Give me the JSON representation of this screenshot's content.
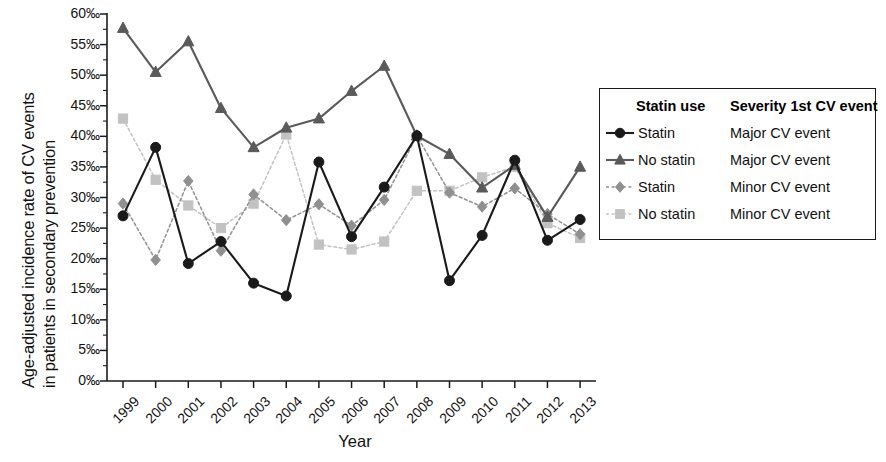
{
  "chart_data": {
    "type": "line",
    "title": "",
    "xlabel": "Year",
    "ylabel_line1": "Age-adjusted incidence rate of CV events",
    "ylabel_line2": "in patients in secondary prevention",
    "categories": [
      "1999",
      "2000",
      "2001",
      "2002",
      "2003",
      "2004",
      "2005",
      "2006",
      "2007",
      "2008",
      "2009",
      "2010",
      "2011",
      "2012",
      "2013"
    ],
    "ytick_labels": [
      "60‰",
      "55‰",
      "50‰",
      "45‰",
      "40‰",
      "35‰",
      "30‰",
      "25‰",
      "20‰",
      "15‰",
      "10‰",
      "5‰",
      "0‰"
    ],
    "ytick_values": [
      60,
      55,
      50,
      45,
      40,
      35,
      30,
      25,
      20,
      15,
      10,
      5,
      0
    ],
    "ylim": [
      0,
      60
    ],
    "grid": false,
    "legend_position": "right",
    "series": [
      {
        "name": "Statin — Major CV event",
        "statin_use": "Statin",
        "severity": "Major CV event",
        "color": "#1a1a1a",
        "marker": "circle",
        "linestyle": "solid",
        "values": [
          27.0,
          38.2,
          19.2,
          22.8,
          16.0,
          13.9,
          35.8,
          23.6,
          31.7,
          40.1,
          16.4,
          23.8,
          36.1,
          23.0,
          26.4
        ]
      },
      {
        "name": "No statin — Major CV event",
        "statin_use": "No statin",
        "severity": "Major CV event",
        "color": "#5a5a5a",
        "marker": "triangle",
        "linestyle": "solid",
        "values": [
          57.7,
          50.5,
          55.5,
          44.6,
          38.2,
          41.4,
          42.9,
          47.4,
          51.5,
          40.1,
          37.1,
          31.6,
          35.3,
          26.8,
          35.0
        ]
      },
      {
        "name": "Statin — Minor CV event",
        "statin_use": "Statin",
        "severity": "Minor CV event",
        "color": "#909090",
        "marker": "diamond",
        "linestyle": "dotted",
        "values": [
          29.0,
          19.8,
          32.7,
          21.3,
          30.5,
          26.3,
          28.9,
          25.4,
          29.6,
          40.1,
          30.8,
          28.5,
          31.5,
          27.3,
          24.0
        ]
      },
      {
        "name": "No statin — Minor CV event",
        "statin_use": "No statin",
        "severity": "Minor CV event",
        "color": "#c2c2c2",
        "marker": "square",
        "linestyle": "dotted",
        "values": [
          42.9,
          32.9,
          28.7,
          25.0,
          29.0,
          40.3,
          22.3,
          21.5,
          22.8,
          31.1,
          31.1,
          33.3,
          35.0,
          25.8,
          23.4
        ]
      }
    ]
  },
  "legend": {
    "header": {
      "statin_use": "Statin use",
      "severity": "Severity 1st CV event"
    },
    "rows": [
      {
        "use": "Statin",
        "severity": "Major CV event"
      },
      {
        "use": "No statin",
        "severity": "Major CV event"
      },
      {
        "use": "Statin",
        "severity": "Minor CV event"
      },
      {
        "use": "No statin",
        "severity": "Minor CV event"
      }
    ]
  },
  "axis": {
    "x_title": "Year"
  }
}
